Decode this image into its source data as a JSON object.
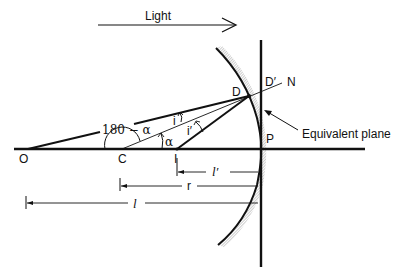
{
  "figure": {
    "type": "ray-optics-diagram",
    "colors": {
      "ink": "#111111",
      "background": "#ffffff",
      "hatch": "#9a9a9a"
    }
  },
  "labels": {
    "light": "Light",
    "point_O": "O",
    "point_C": "C",
    "point_I": "I",
    "point_P": "P",
    "point_D": "D",
    "point_D_prime": "D′",
    "point_N": "N",
    "angle_i": "i",
    "angle_i_prime": "i′",
    "angle_alpha": "α",
    "angle_180_minus_alpha": "180 − α",
    "equivalent_plane": "Equivalent plane",
    "dim_l_prime": "l′",
    "dim_r": "r",
    "dim_l": "l"
  },
  "elements": {
    "optical_axis": "horizontal line through O, C, I, P",
    "mirror": "concave spherical mirror arc with hatched back surface",
    "equivalent_plane": "vertical line through P",
    "incident_ray": "O to D",
    "reflected_ray": "D to I",
    "normal": "C through D to N",
    "dimensions": [
      "l′ (I to P)",
      "r (C to P)",
      "l (O to P)"
    ]
  }
}
